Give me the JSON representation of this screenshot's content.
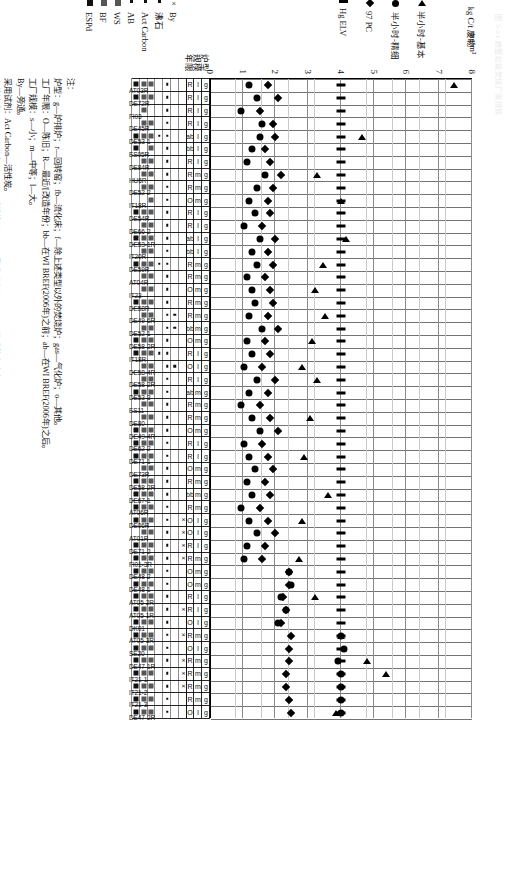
{
  "faint_header": "图 3-21  欧盟垃圾焚烧厂汞排放",
  "axes": {
    "left_title": "kg C/t 废物",
    "left_ticks": [
      "8",
      "7",
      "6",
      "5",
      "4",
      "3",
      "2",
      "1",
      "0"
    ],
    "bottom_title": "mg/m³",
    "bottom_ticks": [
      "0.1",
      "0.09",
      "0.08",
      "0.07",
      "0.06",
      "0.05",
      "0.04",
      "0.03",
      "0.02",
      "0.01",
      "0"
    ]
  },
  "series_legend": [
    {
      "symbol": "triangle",
      "label": "半小时-基本"
    },
    {
      "symbol": "circle",
      "label": "半小时-精细"
    },
    {
      "symbol": "diamond",
      "label": "97 PC"
    },
    {
      "symbol": "dash",
      "label": "Hg ELV"
    }
  ],
  "table_row_headers": [
    "炉型",
    "规模",
    "年限"
  ],
  "technique_legend": [
    {
      "symbol": "x",
      "label": "By"
    },
    {
      "symbol": "dot",
      "label": "沸石"
    },
    {
      "symbol": "dot",
      "label": "Act Carbon"
    },
    {
      "symbol": "dot",
      "label": "AB"
    },
    {
      "symbol": "block",
      "label": "WS"
    },
    {
      "symbol": "block",
      "label": "BF"
    },
    {
      "symbol": "block-dark",
      "label": "ESPd"
    }
  ],
  "notes": {
    "title": "注：",
    "lines": [
      "炉型：g—炉排炉；r—回转窑；fb—流化床；f—除上述类型以外的焚烧炉；gas—气化炉；o—其他。",
      "工厂年限：O—陈旧；R—最近/[改造年份；bb—在WI BREF(2006年)之前；ab—在WI BREF(2006年)之后。",
      "工厂规模：s—小；m—中等；l—大。",
      "By—旁通。",
      "采用试剂：Act Carbon—活性炭。",
      "安装技术：AB—吸附床；WS—湿式洗涤器；BF—袋式过滤器；ESPd—干式静电除尘器。"
    ]
  },
  "chart_data": {
    "type": "scatter",
    "title": "",
    "ylabel": "kg C/t 废物",
    "xlabel": "mg/m³",
    "ylim": [
      0,
      8
    ],
    "xlim": [
      0,
      0.1
    ],
    "grid": true,
    "legend_position": "bottom-left",
    "categories": [
      "AT03R",
      "DE72R",
      "FI03",
      "DE45R",
      "DE53-1",
      "ES05R",
      "DE84R",
      "HU6R",
      "DE52-2",
      "IT18R",
      "DE54R",
      "DE66-2",
      "DE53-1R",
      "IT20R",
      "DE59R",
      "AT04R",
      "IT23",
      "DE58R",
      "DE49-6R",
      "DE52-1",
      "DE58-2R",
      "IT18R",
      "DE58-4R",
      "DE58-2R",
      "DE53-3",
      "ES11",
      "DE80",
      "DE49-4R",
      "DE62-2",
      "DE71-1",
      "DE73R",
      "DE58-2R",
      "DE67-1",
      "AT06R",
      "DE06R",
      "AT01R",
      "DE71-2",
      "FI01-3R",
      "DE48-2",
      "DE48-1",
      "AT05-2R",
      "AT05-1R",
      "DK01",
      "AT05-3R",
      "SE20",
      "DE47-1R",
      "IT21-1",
      "IT21-2",
      "IT21-3",
      "DE47-2R"
    ],
    "series": [
      {
        "name": "半小时-基本",
        "symbol": "triangle",
        "values": [
          0.093,
          null,
          null,
          null,
          0.058,
          null,
          null,
          0.041,
          null,
          0.05,
          null,
          null,
          0.052,
          null,
          0.043,
          null,
          0.04,
          null,
          0.044,
          null,
          0.039,
          null,
          0.035,
          0.041,
          null,
          null,
          0.038,
          null,
          null,
          0.036,
          null,
          null,
          0.045,
          null,
          0.035,
          null,
          null,
          0.034,
          null,
          null,
          0.04,
          null,
          null,
          0.05,
          null,
          0.06,
          0.067,
          null,
          null,
          0.048
        ]
      },
      {
        "name": "半小时-精细",
        "symbol": "circle",
        "values": [
          0.015,
          0.018,
          0.012,
          0.02,
          0.019,
          0.016,
          0.014,
          0.021,
          0.018,
          0.015,
          0.017,
          0.013,
          0.019,
          0.016,
          0.018,
          0.014,
          0.016,
          0.017,
          0.015,
          0.02,
          0.014,
          0.016,
          0.013,
          0.018,
          0.015,
          0.012,
          0.016,
          0.019,
          0.013,
          0.015,
          0.017,
          0.014,
          0.016,
          0.012,
          0.015,
          0.018,
          0.014,
          0.013,
          0.03,
          0.031,
          0.027,
          0.029,
          0.026,
          0.05,
          0.051,
          0.049,
          0.05,
          0.05,
          0.05,
          0.05
        ]
      },
      {
        "name": "97 PC",
        "symbol": "diamond",
        "values": [
          0.022,
          0.026,
          0.019,
          0.024,
          0.025,
          0.021,
          0.023,
          0.027,
          0.024,
          0.022,
          0.023,
          0.02,
          0.025,
          0.022,
          0.024,
          0.021,
          0.023,
          0.024,
          0.022,
          0.026,
          0.021,
          0.023,
          0.02,
          0.025,
          0.022,
          0.019,
          0.023,
          0.026,
          0.02,
          0.022,
          0.024,
          0.021,
          0.023,
          0.019,
          0.022,
          0.025,
          0.021,
          0.02,
          0.03,
          0.03,
          0.028,
          0.029,
          0.027,
          0.031,
          0.03,
          0.03,
          0.029,
          0.029,
          0.03,
          0.031
        ]
      },
      {
        "name": "Hg ELV",
        "symbol": "dash",
        "values": [
          0.05,
          0.05,
          0.05,
          0.05,
          0.05,
          0.05,
          0.05,
          0.05,
          0.05,
          0.05,
          0.05,
          0.05,
          0.05,
          0.05,
          0.05,
          0.05,
          0.05,
          0.05,
          0.05,
          0.05,
          0.05,
          0.05,
          0.05,
          0.05,
          0.05,
          0.05,
          0.05,
          0.05,
          0.05,
          0.05,
          0.05,
          0.05,
          0.05,
          0.05,
          0.05,
          0.05,
          0.05,
          0.05,
          0.05,
          0.05,
          0.05,
          0.05,
          0.05,
          0.05,
          0.05,
          0.05,
          0.05,
          0.05,
          0.05,
          0.05
        ]
      }
    ],
    "attribute_table": {
      "rows": [
        "炉型",
        "规模",
        "年限"
      ],
      "furnace": [
        "g",
        "g",
        "g",
        "g",
        "g",
        "g",
        "g",
        "g",
        "g",
        "g",
        "g",
        "g",
        "g",
        "g",
        "g",
        "g",
        "g",
        "g",
        "g",
        "g",
        "g",
        "g",
        "g",
        "g",
        "g",
        "g",
        "g",
        "g",
        "g",
        "g",
        "g",
        "g",
        "g",
        "g",
        "g",
        "g",
        "g",
        "g",
        "g",
        "g",
        "g",
        "g",
        "g",
        "g",
        "g",
        "g",
        "g",
        "g",
        "g",
        "g"
      ],
      "scale": [
        "l",
        "l",
        "l",
        "l",
        "l",
        "l",
        "l",
        "m",
        "m",
        "m",
        "l",
        "l",
        "l",
        "l",
        "m",
        "m",
        "m",
        "m",
        "m",
        "m",
        "m",
        "l",
        "l",
        "l",
        "m",
        "m",
        "m",
        "m",
        "l",
        "l",
        "m",
        "m",
        "m",
        "m",
        "l",
        "l",
        "l",
        "m",
        "m",
        "m",
        "l",
        "l",
        "l",
        "m",
        "l",
        "m",
        "m",
        "m",
        "m",
        "l"
      ],
      "year": [
        "R",
        "R",
        "R",
        "R",
        "ab",
        "bb",
        "R",
        "R",
        "R",
        "O",
        "R",
        "R",
        "ab",
        "bb",
        "R",
        "R",
        "O",
        "R",
        "R",
        "bb",
        "O",
        "R",
        "O",
        "R",
        "ab",
        "R",
        "R",
        "O",
        "R",
        "R",
        "O",
        "R",
        "bb",
        "R",
        "O",
        "O",
        "R",
        "R",
        "O",
        "O",
        "R",
        "R",
        "O",
        "R",
        "O",
        "R",
        "R",
        "R",
        "R",
        "O"
      ],
      "techniques": [
        "By",
        "沸石",
        "Act Carbon",
        "AB",
        "WS",
        "BF",
        "ESPd"
      ]
    }
  }
}
